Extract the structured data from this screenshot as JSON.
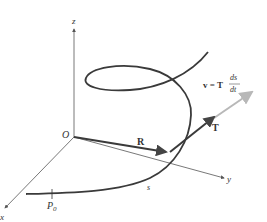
{
  "figure": {
    "axes": {
      "x_label": "x",
      "y_label": "y",
      "z_label": "z",
      "origin_label": "O"
    },
    "vectors": {
      "position_label": "R",
      "tangent_label": "T",
      "velocity_lhs": "v = T",
      "velocity_num": "ds",
      "velocity_den": "dt"
    },
    "curve": {
      "start_point_label": "P",
      "start_point_sub": "0",
      "arc_length_label": "s"
    },
    "colors": {
      "curve": "#3a3a3a",
      "axis": "#555555",
      "velocity": "#b8b8b8"
    }
  }
}
